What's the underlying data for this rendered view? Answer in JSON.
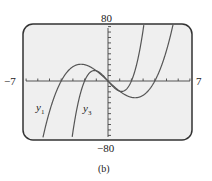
{
  "chart_data": {
    "type": "line",
    "title": "",
    "caption": "(b)",
    "xlim": [
      -7,
      7
    ],
    "ylim": [
      -80,
      80
    ],
    "xtick_step": 1,
    "ytick_step": 8,
    "grid": false,
    "axis_labels": {
      "xmin": "−7",
      "xmax": "7",
      "ymax": "80",
      "ymin": "−80"
    },
    "series": [
      {
        "name": "y1",
        "label": "y₁",
        "formula_approx": "x^3 - 16x",
        "zeros": [
          -4,
          0,
          4
        ],
        "x": [
          -5.6,
          -5,
          -4,
          -3,
          -2.3,
          -2,
          -1,
          0,
          1,
          2,
          2.3,
          3,
          4,
          5,
          5.7
        ],
        "y": [
          -86,
          -45,
          0,
          21,
          24.6,
          24,
          15,
          0,
          -15,
          -24,
          -24.6,
          -21,
          0,
          45,
          94
        ]
      },
      {
        "name": "y3",
        "label": "y₃",
        "formula_approx": "5x(x^2 - 4)",
        "zeros": [
          -2,
          0,
          2
        ],
        "x": [
          -2.8,
          -2.5,
          -2,
          -1.5,
          -1.15,
          -1,
          0,
          1,
          1.15,
          1.5,
          2,
          2.5,
          2.8
        ],
        "y": [
          -86,
          -28,
          0,
          13,
          15.4,
          15,
          0,
          -15,
          -15.4,
          -13,
          0,
          28,
          86
        ]
      }
    ]
  },
  "labels": {
    "y1": "y",
    "y1_sub": "1",
    "y3": "y",
    "y3_sub": "3",
    "caption": "(b)",
    "xmin": "−7",
    "xmax": "7",
    "ymax": "80",
    "ymin": "−80"
  }
}
